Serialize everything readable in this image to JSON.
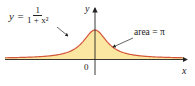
{
  "chart_data": {
    "type": "area",
    "title": "",
    "function": "y = 1/(1+x^2)",
    "xlabel": "x",
    "ylabel": "y",
    "x_tick_labels": [
      "0"
    ],
    "annotations": [
      {
        "text": "y = 1/(1+x²)",
        "points_to": "curve"
      },
      {
        "text": "area = π",
        "points_to": "shaded region"
      }
    ],
    "x": [
      -6,
      -4,
      -3,
      -2,
      -1,
      0,
      1,
      2,
      3,
      4,
      6
    ],
    "values": [
      0.027,
      0.059,
      0.1,
      0.2,
      0.5,
      1.0,
      0.5,
      0.2,
      0.1,
      0.059,
      0.027
    ],
    "xlim": [
      -6.2,
      6.2
    ],
    "ylim": [
      0,
      1.3
    ],
    "grid": false,
    "colors": {
      "fill": "#fbe7a1",
      "curve": "#d4573b",
      "axis": "#222222"
    }
  },
  "labels": {
    "eq_lhs": "y =",
    "eq_num": "1",
    "eq_den": "1 + x²",
    "area": "area = π",
    "y_axis": "y",
    "x_axis": "x",
    "origin": "0"
  }
}
